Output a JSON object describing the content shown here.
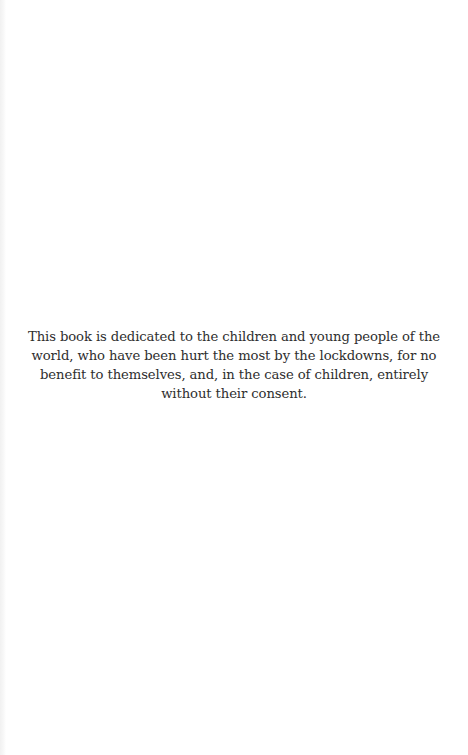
{
  "page": {
    "type": "dedication",
    "background_color": "#ffffff",
    "text_color": "#2e2e2e",
    "dedication": {
      "lines": [
        "This book is dedicated to the children and young people of the",
        "world, who have been hurt the most by the lockdowns, for no",
        "benefit to themselves, and, in the case of children, entirely",
        "without their consent."
      ],
      "full_text": "This book is dedicated to the children and young people of the world, who have been hurt the most by the lockdowns, for no benefit to themselves, and, in the case of children, entirely without their consent."
    }
  }
}
